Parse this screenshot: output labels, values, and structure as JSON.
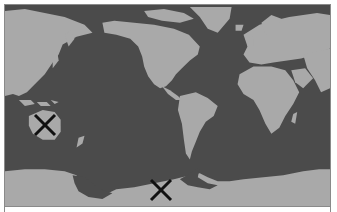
{
  "map": {
    "type": "world-map",
    "projection": "pacific-centered",
    "colors": {
      "ocean": "#4b4b4b",
      "land": "#a9a9a9",
      "border": "#8a8a8a",
      "marker": "#111111"
    },
    "regions_visible": [
      "Asia",
      "North America",
      "South America",
      "Europe",
      "Africa",
      "Australia",
      "Antarctica",
      "Greenland",
      "New Zealand"
    ]
  },
  "markers": [
    {
      "id": "marker-1",
      "icon": "x-mark",
      "location": "Australia",
      "x": 43,
      "y": 123
    },
    {
      "id": "marker-2",
      "icon": "x-mark",
      "location": "Antarctica",
      "x": 160,
      "y": 187
    }
  ]
}
